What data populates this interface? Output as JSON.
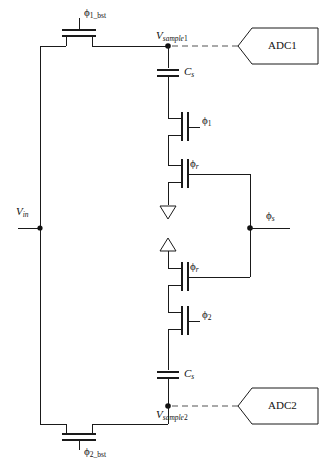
{
  "figure": {
    "type": "circuit-schematic"
  },
  "labels": {
    "phi1_bst": {
      "symbol": "ϕ",
      "sub": "1_bst"
    },
    "phi2_bst": {
      "symbol": "ϕ",
      "sub": "2_bst"
    },
    "phi1": {
      "symbol": "ϕ",
      "sub": "1"
    },
    "phi2": {
      "symbol": "ϕ",
      "sub": "2"
    },
    "phi_r_top": {
      "symbol": "ϕ",
      "sub": "r"
    },
    "phi_r_bottom": {
      "symbol": "ϕ",
      "sub": "r"
    },
    "phi_s": {
      "symbol": "ϕ",
      "sub": "s"
    },
    "vin": {
      "symbol": "V",
      "sub": "in"
    },
    "vsample1": {
      "symbol": "V",
      "sub": "sample",
      "suffix": "1"
    },
    "vsample2": {
      "symbol": "V",
      "sub": "sample",
      "suffix": "2"
    },
    "cs_top": {
      "symbol": "C",
      "sub": "s"
    },
    "cs_bottom": {
      "symbol": "C",
      "sub": "s"
    }
  },
  "blocks": {
    "adc1": "ADC1",
    "adc2": "ADC2"
  },
  "colors": {
    "wire": "#1a1a1a",
    "dashed": "#555555",
    "background": "#ffffff",
    "text": "#111111"
  }
}
